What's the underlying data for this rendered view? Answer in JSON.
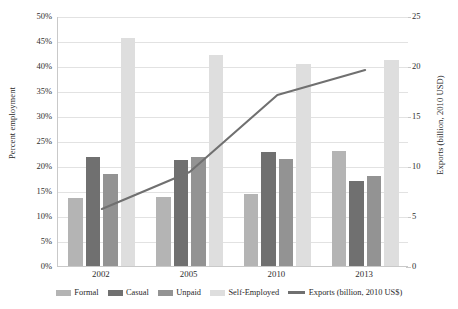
{
  "chart_data": {
    "type": "bar",
    "title": "",
    "subtitle": "",
    "xlabel": "",
    "ylabel": "Percent employment",
    "y2label": "Exports (billion, 2010 USD)",
    "categories": [
      "2002",
      "2005",
      "2010",
      "2013"
    ],
    "ylim": [
      0,
      0.5
    ],
    "y2lim": [
      0,
      25
    ],
    "yticks": [
      "0%",
      "5%",
      "10%",
      "15%",
      "20%",
      "25%",
      "30%",
      "35%",
      "40%",
      "45%",
      "50%"
    ],
    "ytick_values": [
      0,
      5,
      10,
      15,
      20,
      25,
      30,
      35,
      40,
      45,
      50
    ],
    "y2ticks": [
      "0",
      "5",
      "10",
      "15",
      "20",
      "25"
    ],
    "y2tick_values": [
      0,
      5,
      10,
      15,
      20,
      25
    ],
    "grid": true,
    "legend_position": "bottom",
    "series": [
      {
        "name": "Formal",
        "type": "bar",
        "axis": "left",
        "color": "#b4b4b4",
        "values": [
          13.7,
          13.9,
          14.5,
          23.0
        ]
      },
      {
        "name": "Casual",
        "type": "bar",
        "axis": "left",
        "color": "#707070",
        "values": [
          21.8,
          21.3,
          22.8,
          17.0
        ]
      },
      {
        "name": "Unpaid",
        "type": "bar",
        "axis": "left",
        "color": "#939393",
        "values": [
          18.4,
          21.8,
          21.5,
          18.0
        ]
      },
      {
        "name": "Self-Employed",
        "type": "bar",
        "axis": "left",
        "color": "#dedede",
        "values": [
          45.6,
          42.3,
          40.4,
          41.3
        ]
      },
      {
        "name": "Exports (billion, 2010 US$)",
        "type": "line",
        "axis": "right",
        "color": "#707070",
        "values": [
          5.8,
          9.5,
          17.2,
          19.7
        ]
      }
    ]
  },
  "axes": {
    "left_title": "Percent employment",
    "right_title": "Exports (billion, 2010 USD)",
    "left_ticks": [
      "50%",
      "45%",
      "40%",
      "35%",
      "30%",
      "25%",
      "20%",
      "15%",
      "10%",
      "5%",
      "0%"
    ],
    "right_ticks": [
      "25",
      "20",
      "15",
      "10",
      "5",
      "0"
    ],
    "x_ticks": [
      "2002",
      "2005",
      "2010",
      "2013"
    ]
  },
  "legend": {
    "items": [
      {
        "label": "Formal",
        "color": "#b4b4b4",
        "marker": "bar-swatch"
      },
      {
        "label": "Casual",
        "color": "#707070",
        "marker": "bar-swatch"
      },
      {
        "label": "Unpaid",
        "color": "#939393",
        "marker": "bar-swatch"
      },
      {
        "label": "Self-Employed",
        "color": "#dedede",
        "marker": "bar-swatch"
      },
      {
        "label": "Exports (billion, 2010 US$)",
        "color": "#707070",
        "marker": "line-swatch"
      }
    ]
  },
  "colors": {
    "formal": "#b4b4b4",
    "casual": "#707070",
    "unpaid": "#939393",
    "self_employed": "#dedede",
    "exports_line": "#707070",
    "gridline": "#e2e2e2",
    "axis": "#c9c9c9",
    "text": "#2a2a2a",
    "background": "#ffffff"
  }
}
